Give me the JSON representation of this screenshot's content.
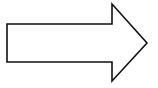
{
  "diagram": {
    "shape": "right-arrow",
    "stroke_color": "#111111",
    "fill_color": "#ffffff",
    "stroke_width": 1.6,
    "points": "7,24 112,24 112,4 147,43 112,81 112,62 7,62"
  }
}
